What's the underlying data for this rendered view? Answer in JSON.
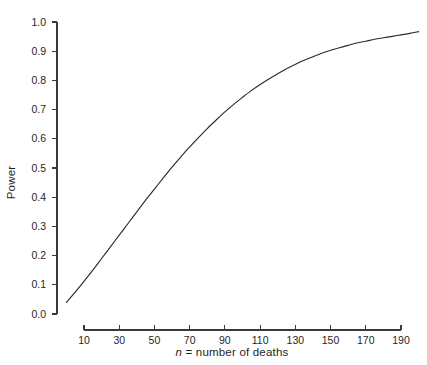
{
  "chart_data": {
    "type": "line",
    "title": "",
    "xlabel": "n = number of deaths",
    "xlabel_italic_part": "n",
    "xlabel_rest": " = number of deaths",
    "ylabel": "Power",
    "xlim": [
      0,
      200
    ],
    "ylim": [
      0.0,
      1.0
    ],
    "grid": false,
    "legend": "none",
    "xticks": [
      10,
      30,
      50,
      70,
      90,
      110,
      130,
      150,
      170,
      190
    ],
    "xtick_labels": [
      "10",
      "30",
      "50",
      "70",
      "90",
      "110",
      "130",
      "150",
      "170",
      "190"
    ],
    "yticks": [
      0.0,
      0.1,
      0.2,
      0.3,
      0.4,
      0.5,
      0.6,
      0.7,
      0.8,
      0.9,
      1.0
    ],
    "ytick_labels": [
      "0.0",
      "0.1",
      "0.2",
      "0.3",
      "0.4",
      "0.5",
      "0.6",
      "0.7",
      "0.8",
      "0.9",
      "1.0"
    ],
    "series": [
      {
        "name": "Power curve",
        "color": "#2b2b2b",
        "x": [
          0,
          5,
          10,
          15,
          20,
          25,
          30,
          35,
          40,
          45,
          50,
          55,
          60,
          65,
          70,
          75,
          80,
          85,
          90,
          95,
          100,
          105,
          110,
          115,
          120,
          125,
          130,
          135,
          140,
          145,
          150,
          155,
          160,
          165,
          170,
          175,
          180,
          185,
          190,
          195,
          200
        ],
        "y": [
          0.04,
          0.075,
          0.112,
          0.15,
          0.19,
          0.23,
          0.27,
          0.31,
          0.35,
          0.39,
          0.428,
          0.466,
          0.503,
          0.538,
          0.572,
          0.604,
          0.635,
          0.664,
          0.692,
          0.718,
          0.742,
          0.765,
          0.786,
          0.805,
          0.823,
          0.84,
          0.855,
          0.869,
          0.881,
          0.893,
          0.903,
          0.912,
          0.92,
          0.928,
          0.934,
          0.941,
          0.946,
          0.951,
          0.956,
          0.961,
          0.967
        ]
      }
    ],
    "colors": {
      "line": "#2b2b2b",
      "axis": "#3a3a3a",
      "text": "#1f1f1f",
      "background": "#ffffff"
    }
  },
  "axes": {
    "y_axis_label": "Power",
    "x_axis_label_full": "n = number of deaths"
  }
}
